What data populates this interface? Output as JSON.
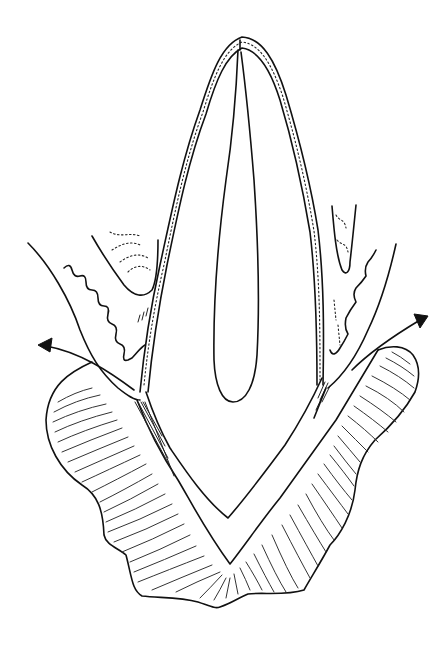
{
  "figure": {
    "title": "",
    "background": "#ffffff",
    "ink_color": "#111111",
    "labels": []
  },
  "parts": [
    {
      "id": "enamel-crown",
      "description": "Stippled enamel layer outlining the crown"
    },
    {
      "id": "pulp-chamber",
      "description": "Elongated central pulp canal"
    },
    {
      "id": "root-dentin",
      "description": "Inner V-shaped root outline"
    },
    {
      "id": "alveolar-bone",
      "description": "Hatched bone surrounding the root"
    },
    {
      "id": "gingiva-left",
      "description": "Left gum tissue with wavy edge and calculus deposit"
    },
    {
      "id": "gingiva-right",
      "description": "Right gum tissue with wavy edge and calculus deposit"
    },
    {
      "id": "periodontal-fibers",
      "description": "Fine fiber lines between root and bone"
    },
    {
      "id": "arrow-left",
      "description": "Curved arrow pointing outward to upper left"
    },
    {
      "id": "arrow-right",
      "description": "Curved arrow pointing outward to upper right"
    }
  ]
}
